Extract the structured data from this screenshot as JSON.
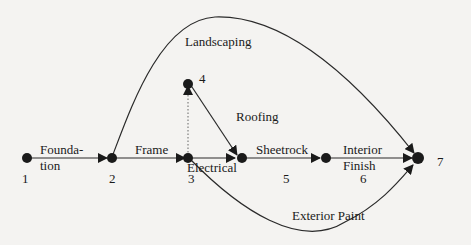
{
  "diagram": {
    "type": "activity-on-arrow network",
    "nodes": [
      {
        "id": "1",
        "label": "1"
      },
      {
        "id": "2",
        "label": "2"
      },
      {
        "id": "3",
        "label": "3"
      },
      {
        "id": "4",
        "label": "4"
      },
      {
        "id": "5",
        "label": "5"
      },
      {
        "id": "6",
        "label": "6"
      },
      {
        "id": "7",
        "label": "7"
      }
    ],
    "edges": [
      {
        "from": "1",
        "to": "2",
        "label_line1": "Founda-",
        "label_line2": "tion"
      },
      {
        "from": "2",
        "to": "3",
        "label": "Frame"
      },
      {
        "from": "2",
        "to": "7",
        "label": "Landscaping"
      },
      {
        "from": "3",
        "to": "4",
        "label": "",
        "style": "dotted (dummy)"
      },
      {
        "from": "4",
        "to": "5",
        "label": "Roofing"
      },
      {
        "from": "3",
        "to": "5",
        "label": "Electrical"
      },
      {
        "from": "5",
        "to": "6",
        "label": "Sheetrock"
      },
      {
        "from": "6",
        "to": "7",
        "label_line1": "Interior",
        "label_line2": "Finish"
      },
      {
        "from": "3",
        "to": "7",
        "label": "Exterior Paint"
      }
    ]
  }
}
